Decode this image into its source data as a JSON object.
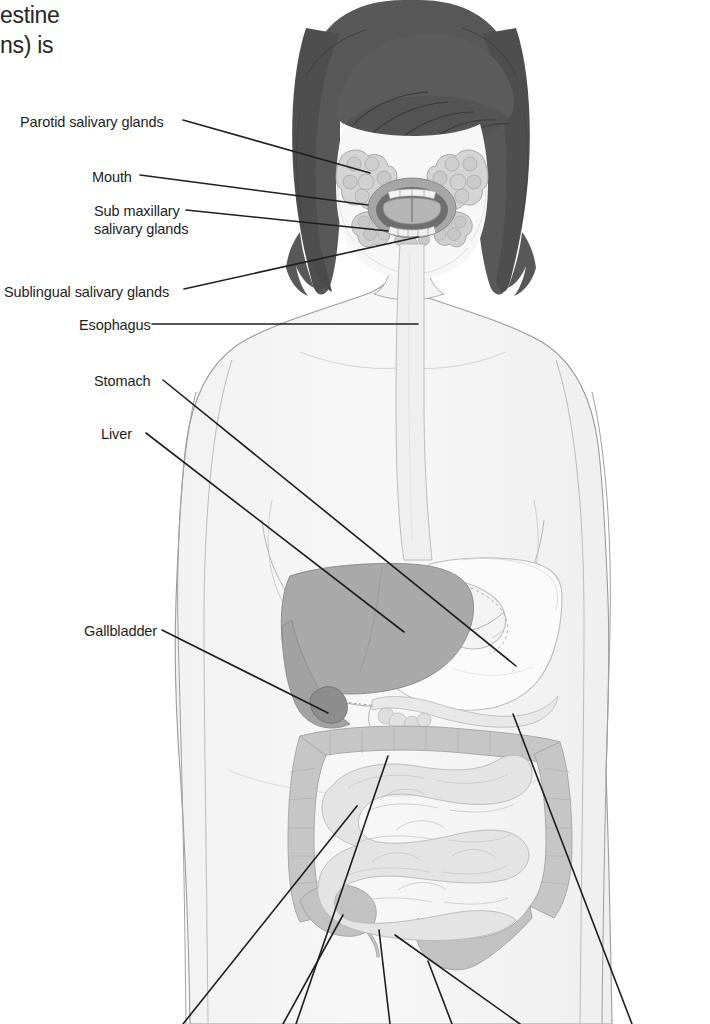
{
  "caption_fragments": [
    {
      "id": "frag-1",
      "text": "estine",
      "x": 0,
      "y": 2
    },
    {
      "id": "frag-2",
      "text": "ns) is",
      "x": 0,
      "y": 32
    }
  ],
  "labels": [
    {
      "id": "parotid-salivary-glands",
      "text": "Parotid salivary glands",
      "x": 20,
      "y": 113,
      "align": "left"
    },
    {
      "id": "mouth",
      "text": "Mouth",
      "x": 92,
      "y": 168,
      "align": "left"
    },
    {
      "id": "sub-maxillary-salivary-glands",
      "text": "Sub maxillary",
      "text_line2": "salivary glands",
      "x": 94,
      "y": 202,
      "align": "left"
    },
    {
      "id": "sublingual-salivary-glands",
      "text": "Sublingual salivary glands",
      "x": 4,
      "y": 283,
      "align": "left"
    },
    {
      "id": "esophagus",
      "text": "Esophagus",
      "x": 79,
      "y": 316,
      "align": "left"
    },
    {
      "id": "stomach",
      "text": "Stomach",
      "x": 94,
      "y": 372,
      "align": "left"
    },
    {
      "id": "liver",
      "text": "Liver",
      "x": 101,
      "y": 425,
      "align": "left"
    },
    {
      "id": "gallbladder",
      "text": "Gallbladder",
      "x": 84,
      "y": 622,
      "align": "left"
    }
  ],
  "leader_lines": [
    {
      "id": "leader-parotid",
      "from": [
        183,
        120
      ],
      "to": [
        370,
        173
      ]
    },
    {
      "id": "leader-mouth",
      "from": [
        140,
        175
      ],
      "to": [
        368,
        205
      ]
    },
    {
      "id": "leader-submaxillary",
      "from": [
        186,
        210
      ],
      "to": [
        388,
        231
      ]
    },
    {
      "id": "leader-sublingual",
      "from": [
        184,
        289
      ],
      "to": [
        418,
        237
      ]
    },
    {
      "id": "leader-esophagus",
      "from": [
        152,
        324
      ],
      "to": [
        418,
        324
      ]
    },
    {
      "id": "leader-stomach",
      "from": [
        163,
        380
      ],
      "to": [
        516,
        666
      ]
    },
    {
      "id": "leader-liver",
      "from": [
        146,
        433
      ],
      "to": [
        404,
        632
      ]
    },
    {
      "id": "leader-gallbladder",
      "from": [
        162,
        630
      ],
      "to": [
        328,
        713
      ]
    },
    {
      "id": "leader-bottom-1",
      "from": [
        183,
        1024
      ],
      "to": [
        357,
        806
      ]
    },
    {
      "id": "leader-bottom-2",
      "from": [
        283,
        1024
      ],
      "to": [
        343,
        915
      ]
    },
    {
      "id": "leader-bottom-3",
      "from": [
        296,
        1024
      ],
      "to": [
        388,
        756
      ]
    },
    {
      "id": "leader-bottom-4",
      "from": [
        390,
        1024
      ],
      "to": [
        379,
        930
      ]
    },
    {
      "id": "leader-bottom-5",
      "from": [
        452,
        1024
      ],
      "to": [
        428,
        961
      ]
    },
    {
      "id": "leader-bottom-6",
      "from": [
        520,
        1024
      ],
      "to": [
        395,
        935
      ]
    },
    {
      "id": "leader-bottom-7",
      "from": [
        632,
        1024
      ],
      "to": [
        513,
        714
      ]
    }
  ],
  "colors": {
    "hair": "#585858",
    "skin": "#f5f5f5",
    "body_outline": "#9b9b9b",
    "liver": "#a9a9a9",
    "gallbladder": "#8d8d8d",
    "stomach": "#fbfbfb",
    "large_intestine": "#c6c6c6",
    "small_intestine": "#e2e2e2",
    "salivary_gland": "#d2d2d2",
    "oral_cavity": "#6e6e6e",
    "tongue": "#b5b5b5",
    "esophagus": "#efefef",
    "leader_line": "#1f1f1f",
    "label_text": "#1d1d1d",
    "background": "#ffffff"
  },
  "organs": [
    {
      "id": "hair",
      "name": "hair"
    },
    {
      "id": "face",
      "name": "face"
    },
    {
      "id": "mouth-cavity",
      "name": "oral-cavity"
    },
    {
      "id": "tongue",
      "name": "tongue"
    },
    {
      "id": "teeth-upper",
      "name": "upper-teeth"
    },
    {
      "id": "teeth-lower",
      "name": "lower-teeth"
    },
    {
      "id": "parotid-gland-left",
      "name": "parotid-gland-left"
    },
    {
      "id": "parotid-gland-right",
      "name": "parotid-gland-right"
    },
    {
      "id": "submaxillary-gland-left",
      "name": "submaxillary-gland-left"
    },
    {
      "id": "submaxillary-gland-right",
      "name": "submaxillary-gland-right"
    },
    {
      "id": "esophagus-tube",
      "name": "esophagus"
    },
    {
      "id": "torso",
      "name": "torso"
    },
    {
      "id": "liver-organ",
      "name": "liver"
    },
    {
      "id": "gallbladder-organ",
      "name": "gallbladder"
    },
    {
      "id": "stomach-organ",
      "name": "stomach"
    },
    {
      "id": "pancreas-organ",
      "name": "pancreas"
    },
    {
      "id": "large-intestine",
      "name": "large-intestine"
    },
    {
      "id": "small-intestine",
      "name": "small-intestine"
    },
    {
      "id": "appendix-organ",
      "name": "appendix"
    }
  ]
}
